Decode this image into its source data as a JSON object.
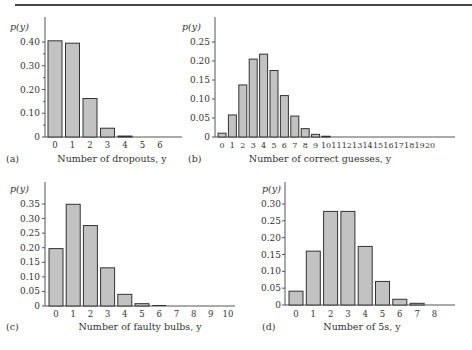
{
  "colors": {
    "bar_fill": "#c2c2c2",
    "bar_stroke": "#333333",
    "axis": "#555555",
    "text": "#333333"
  },
  "chart_data": [
    {
      "id": "a",
      "type": "bar",
      "panel_label": "(a)",
      "title": "",
      "xlabel": "Number of dropouts, y",
      "ylabel": "p(y)",
      "categories": [
        "0",
        "1",
        "2",
        "3",
        "4",
        "5",
        "6"
      ],
      "values": [
        0.405,
        0.395,
        0.162,
        0.037,
        0.004,
        0.0,
        0.0
      ],
      "yticks": [
        0,
        0.1,
        0.2,
        0.3,
        0.4
      ],
      "ytick_labels": [
        "0",
        "0.10",
        "0.20",
        "0.30",
        "0.40"
      ],
      "minor_yticks": [
        0.05,
        0.15,
        0.25,
        0.35
      ],
      "ylim": [
        0,
        0.45
      ],
      "grid": false,
      "legend": null
    },
    {
      "id": "b",
      "type": "bar",
      "panel_label": "(b)",
      "title": "",
      "xlabel": "Number of correct guesses, y",
      "ylabel": "p(y)",
      "categories": [
        "0",
        "1",
        "2",
        "3",
        "4",
        "5",
        "6",
        "7",
        "8",
        "9",
        "10",
        "11",
        "12",
        "13",
        "14",
        "15",
        "16",
        "17",
        "18",
        "19",
        "20"
      ],
      "values": [
        0.01,
        0.058,
        0.137,
        0.205,
        0.218,
        0.175,
        0.109,
        0.055,
        0.022,
        0.007,
        0.002,
        0,
        0,
        0,
        0,
        0,
        0,
        0,
        0,
        0,
        0
      ],
      "yticks": [
        0,
        0.05,
        0.1,
        0.15,
        0.2,
        0.25
      ],
      "ytick_labels": [
        "0",
        "0.05",
        "0.10",
        "0.15",
        "0.20",
        "0.25"
      ],
      "ylim": [
        0,
        0.28
      ],
      "grid": false,
      "legend": null
    },
    {
      "id": "c",
      "type": "bar",
      "panel_label": "(c)",
      "title": "",
      "xlabel": "Number of faulty bulbs, y",
      "ylabel": "p(y)",
      "categories": [
        "0",
        "1",
        "2",
        "3",
        "4",
        "5",
        "6",
        "7",
        "8",
        "9",
        "10"
      ],
      "values": [
        0.197,
        0.349,
        0.276,
        0.131,
        0.04,
        0.008,
        0.001,
        0,
        0,
        0,
        0
      ],
      "yticks": [
        0,
        0.05,
        0.1,
        0.15,
        0.2,
        0.25,
        0.3,
        0.35
      ],
      "ytick_labels": [
        "0",
        "0.05",
        "0.10",
        "0.15",
        "0.20",
        "0.25",
        "0.30",
        "0.35"
      ],
      "ylim": [
        0,
        0.4
      ],
      "grid": false,
      "legend": null
    },
    {
      "id": "d",
      "type": "bar",
      "panel_label": "(d)",
      "title": "",
      "xlabel": "Number of 5s, y",
      "ylabel": "p(y)",
      "categories": [
        "0",
        "1",
        "2",
        "3",
        "4",
        "5",
        "6",
        "7",
        "8"
      ],
      "values": [
        0.041,
        0.16,
        0.278,
        0.278,
        0.174,
        0.07,
        0.017,
        0.005,
        0.0
      ],
      "yticks": [
        0,
        0.05,
        0.1,
        0.15,
        0.2,
        0.25,
        0.3
      ],
      "ytick_labels": [
        "0",
        "0.05",
        "0.10",
        "0.15",
        "0.20",
        "0.25",
        "0.30"
      ],
      "ylim": [
        0,
        0.34
      ],
      "grid": false,
      "legend": null
    }
  ]
}
